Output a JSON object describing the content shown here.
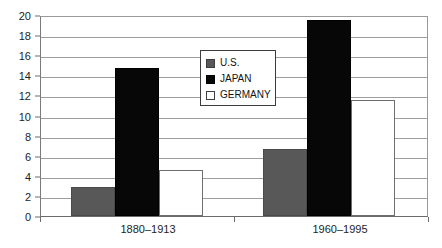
{
  "chart_data": {
    "type": "bar",
    "title": "",
    "xlabel": "",
    "ylabel": "",
    "categories": [
      "1880–1913",
      "1960–1995"
    ],
    "series": [
      {
        "name": "U.S.",
        "color": "#585858",
        "values": [
          2.9,
          6.7
        ]
      },
      {
        "name": "JAPAN",
        "color": "#070707",
        "values": [
          14.7,
          19.5
        ]
      },
      {
        "name": "GERMANY",
        "color": "#ffffff",
        "values": [
          4.6,
          11.5
        ]
      }
    ],
    "ylim": [
      0,
      20
    ],
    "ytick_step": 2,
    "yticks": [
      0,
      2,
      4,
      6,
      8,
      10,
      12,
      14,
      16,
      18,
      20
    ],
    "ytick_labels": [
      "0",
      "2",
      "4",
      "6",
      "8",
      "10",
      "12",
      "14",
      "16",
      "18",
      "20"
    ],
    "grid": true,
    "legend_position": "center",
    "legend_entries": [
      {
        "label": "U.S.",
        "swatch": "gray"
      },
      {
        "label": "JAPAN",
        "swatch": "black"
      },
      {
        "label": "GERMANY",
        "swatch": "white"
      }
    ]
  }
}
